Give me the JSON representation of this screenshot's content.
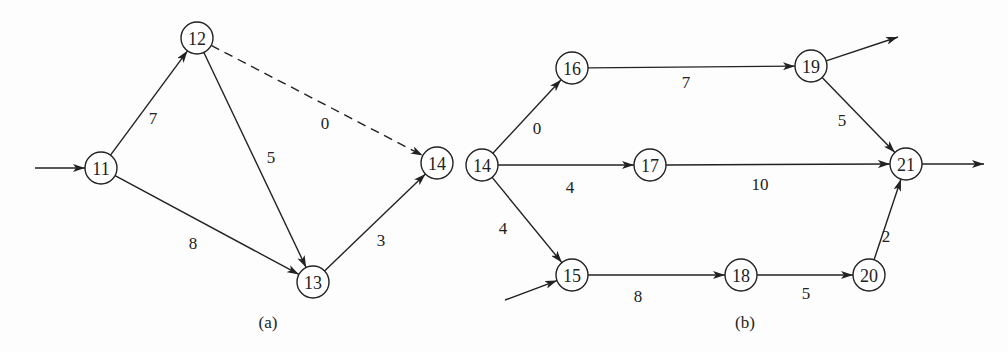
{
  "diagrams": [
    {
      "caption": "(a)",
      "caption_pos": [
        268,
        322
      ],
      "nodes": [
        {
          "id": "11",
          "label": "11",
          "x": 101,
          "y": 168
        },
        {
          "id": "12",
          "label": "12",
          "x": 197,
          "y": 38
        },
        {
          "id": "13",
          "label": "13",
          "x": 313,
          "y": 282
        },
        {
          "id": "14a",
          "label": "14",
          "x": 437,
          "y": 163
        }
      ],
      "edges": [
        {
          "from": "11",
          "to": "12",
          "weight": "7",
          "style": "solid",
          "label_pos": [
            153,
            118
          ]
        },
        {
          "from": "12",
          "to": "13",
          "weight": "5",
          "style": "solid",
          "label_pos": [
            271,
            157
          ]
        },
        {
          "from": "12",
          "to": "14a",
          "weight": "0",
          "style": "dashed",
          "label_pos": [
            325,
            123
          ]
        },
        {
          "from": "11",
          "to": "13",
          "weight": "8",
          "style": "solid",
          "label_pos": [
            193,
            243
          ]
        },
        {
          "from": "13",
          "to": "14a",
          "weight": "3",
          "style": "solid",
          "label_pos": [
            381,
            240
          ]
        }
      ],
      "external_arrows": [
        {
          "from": [
            35,
            168
          ],
          "to": "11",
          "direction": "in"
        }
      ]
    },
    {
      "caption": "(b)",
      "caption_pos": [
        745,
        322
      ],
      "nodes": [
        {
          "id": "14b",
          "label": "14",
          "x": 482,
          "y": 165
        },
        {
          "id": "16",
          "label": "16",
          "x": 572,
          "y": 68
        },
        {
          "id": "17",
          "label": "17",
          "x": 650,
          "y": 165
        },
        {
          "id": "15",
          "label": "15",
          "x": 572,
          "y": 275
        },
        {
          "id": "19",
          "label": "19",
          "x": 811,
          "y": 66
        },
        {
          "id": "21",
          "label": "21",
          "x": 906,
          "y": 164
        },
        {
          "id": "18",
          "label": "18",
          "x": 741,
          "y": 275
        },
        {
          "id": "20",
          "label": "20",
          "x": 869,
          "y": 275
        }
      ],
      "edges": [
        {
          "from": "14b",
          "to": "16",
          "weight": "0",
          "style": "solid",
          "label_pos": [
            537,
            128
          ]
        },
        {
          "from": "14b",
          "to": "17",
          "weight": "4",
          "style": "solid",
          "label_pos": [
            570,
            187
          ]
        },
        {
          "from": "14b",
          "to": "15",
          "weight": "4",
          "style": "solid",
          "label_pos": [
            503,
            228
          ]
        },
        {
          "from": "16",
          "to": "19",
          "weight": "7",
          "style": "solid",
          "label_pos": [
            686,
            82
          ]
        },
        {
          "from": "17",
          "to": "21",
          "weight": "10",
          "style": "solid",
          "label_pos": [
            760,
            184
          ]
        },
        {
          "from": "19",
          "to": "21",
          "weight": "5",
          "style": "solid",
          "label_pos": [
            842,
            120
          ]
        },
        {
          "from": "15",
          "to": "18",
          "weight": "8",
          "style": "solid",
          "label_pos": [
            638,
            296
          ]
        },
        {
          "from": "18",
          "to": "20",
          "weight": "5",
          "style": "solid",
          "label_pos": [
            806,
            293
          ]
        },
        {
          "from": "20",
          "to": "21",
          "weight": "2",
          "style": "solid",
          "label_pos": [
            886,
            236
          ]
        }
      ],
      "external_arrows": [
        {
          "from": [
            505,
            300
          ],
          "to": "15",
          "direction": "in"
        },
        {
          "from": "19",
          "to": [
            898,
            37
          ],
          "direction": "out"
        },
        {
          "from": "21",
          "to": [
            984,
            164
          ],
          "direction": "out"
        }
      ]
    }
  ],
  "style": {
    "stroke_color": "#222222",
    "background": "#fdfdfd",
    "node_radius": 16
  }
}
